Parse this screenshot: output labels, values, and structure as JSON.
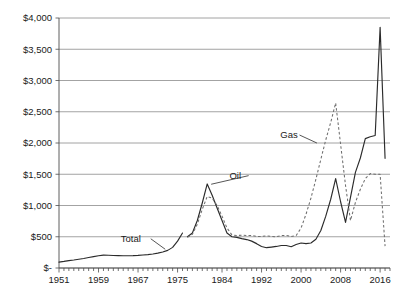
{
  "chart_data": {
    "type": "line",
    "title": "",
    "subtitle": "",
    "xlabel": "",
    "ylabel": "",
    "grid": true,
    "legend_position": "inline-annotations",
    "xlim": [
      1951,
      2018
    ],
    "ylim": [
      0,
      4000
    ],
    "y_ticks": [
      0,
      500,
      1000,
      1500,
      2000,
      2500,
      3000,
      3500,
      4000
    ],
    "y_tick_labels": [
      "$-",
      "$500",
      "$1,000",
      "$1,500",
      "$2,000",
      "$2,500",
      "$3,000",
      "$3,500",
      "$4,000"
    ],
    "x_ticks": [
      1951,
      1959,
      1967,
      1975,
      1984,
      1992,
      2000,
      2008,
      2016
    ],
    "x_tick_labels": [
      "1951",
      "1959",
      "1967",
      "1975",
      "1984",
      "1992",
      "2000",
      "2008",
      "2016"
    ],
    "x_minor_tick_step": 1,
    "annotations": [
      {
        "name": "total-label",
        "text": "Total",
        "x": 1963.5,
        "y": 420,
        "leader_to_x": 1972.5,
        "leader_to_y": 300
      },
      {
        "name": "oil-label",
        "text": "Oil",
        "x": 1985.5,
        "y": 1430,
        "leader_to_x": 1981.8,
        "leader_to_y": 1340
      },
      {
        "name": "gas-label",
        "text": "Gas",
        "x": 1995.8,
        "y": 2080,
        "leader_to_x": 2003.2,
        "leader_to_y": 2000
      }
    ],
    "series": [
      {
        "name": "Total",
        "style": "solid",
        "color": "#2b2b2b",
        "x": [
          1951,
          1952,
          1953,
          1954,
          1955,
          1956,
          1957,
          1958,
          1959,
          1960,
          1961,
          1962,
          1963,
          1964,
          1965,
          1966,
          1967,
          1968,
          1969,
          1970,
          1971,
          1972,
          1973,
          1974,
          1975,
          1976
        ],
        "values": [
          95,
          105,
          118,
          128,
          140,
          152,
          168,
          182,
          196,
          206,
          204,
          200,
          198,
          196,
          196,
          198,
          202,
          208,
          215,
          224,
          238,
          256,
          282,
          330,
          430,
          560
        ]
      },
      {
        "name": "Oil",
        "style": "solid",
        "color": "#2b2b2b",
        "x": [
          1977,
          1978,
          1979,
          1980,
          1981,
          1982,
          1983,
          1984,
          1985,
          1986,
          1987,
          1988,
          1989,
          1990,
          1991,
          1992,
          1993,
          1994,
          1995,
          1996,
          1997,
          1998,
          1999,
          2000,
          2001,
          2002,
          2003,
          2004,
          2005,
          2006,
          2007,
          2008,
          2009,
          2010,
          2011,
          2012,
          2013,
          2014,
          2015,
          2016,
          2017
        ],
        "values": [
          500,
          560,
          760,
          1040,
          1345,
          1165,
          960,
          760,
          560,
          500,
          490,
          470,
          455,
          430,
          390,
          345,
          325,
          335,
          345,
          360,
          360,
          340,
          375,
          400,
          390,
          400,
          460,
          600,
          830,
          1100,
          1430,
          1060,
          730,
          1130,
          1530,
          1760,
          2070,
          2100,
          2120,
          3850,
          1755
        ]
      },
      {
        "name": "Gas",
        "style": "dashed",
        "color": "#6e6e6e",
        "x": [
          1977,
          1978,
          1979,
          1980,
          1981,
          1982,
          1983,
          1984,
          1985,
          1986,
          1987,
          1988,
          1989,
          1990,
          1991,
          1992,
          1993,
          1994,
          1995,
          1996,
          1997,
          1998,
          1999,
          2000,
          2001,
          2002,
          2003,
          2004,
          2005,
          2006,
          2007,
          2008,
          2009,
          2010,
          2011,
          2012,
          2013,
          2014,
          2015,
          2016,
          2017
        ],
        "values": [
          490,
          540,
          700,
          940,
          1145,
          1120,
          1000,
          830,
          640,
          530,
          520,
          525,
          520,
          520,
          505,
          505,
          515,
          505,
          500,
          520,
          520,
          505,
          520,
          640,
          860,
          1120,
          1420,
          1740,
          2050,
          2330,
          2640,
          1980,
          1320,
          760,
          1050,
          1260,
          1430,
          1510,
          1500,
          1500,
          350
        ]
      }
    ]
  },
  "axis": {
    "y_label_0": "$-",
    "y_label_500": "$500",
    "y_label_1000": "$1,000",
    "y_label_1500": "$1,500",
    "y_label_2000": "$2,000",
    "y_label_2500": "$2,500",
    "y_label_3000": "$3,000",
    "y_label_3500": "$3,500",
    "y_label_4000": "$4,000"
  }
}
